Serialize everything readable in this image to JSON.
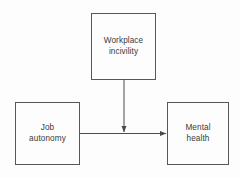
{
  "diagram": {
    "type": "moderation-path-diagram",
    "colors": {
      "background": "#fdfdfd",
      "box_border": "#575757",
      "text": "#3a3a3a",
      "connector": "#4a4a4a"
    },
    "nodes": [
      {
        "id": "workplace-incivility",
        "label": "Workplace\nincivility",
        "role": "moderator",
        "x": 91,
        "y": 13,
        "width": 65,
        "height": 67
      },
      {
        "id": "job-autonomy",
        "label": "Job\nautonomy",
        "role": "predictor",
        "x": 15,
        "y": 102,
        "width": 65,
        "height": 63
      },
      {
        "id": "mental-health",
        "label": "Mental\nhealth",
        "role": "outcome",
        "x": 167,
        "y": 102,
        "width": 62,
        "height": 63
      }
    ],
    "connectors": [
      {
        "id": "autonomy-to-health",
        "from": "job-autonomy",
        "to": "mental-health",
        "orientation": "horizontal",
        "arrowhead": "end"
      },
      {
        "id": "incivility-to-path",
        "from": "workplace-incivility",
        "to": "autonomy-to-health",
        "orientation": "vertical",
        "arrowhead": "end"
      }
    ]
  }
}
